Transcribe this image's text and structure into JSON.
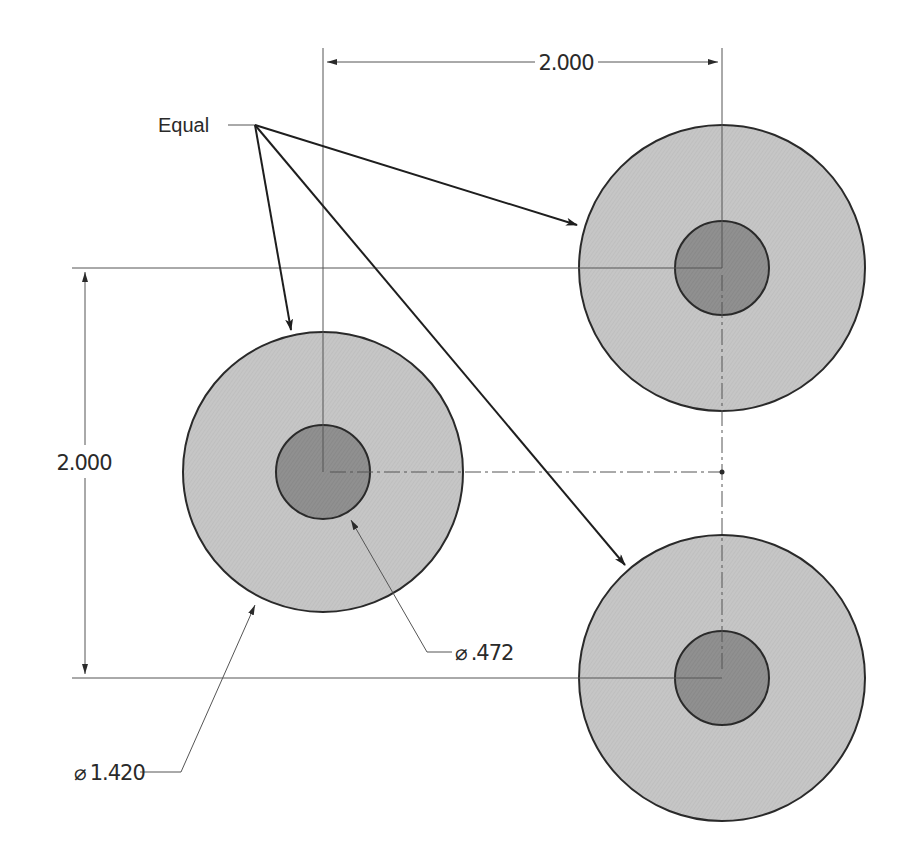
{
  "drawing": {
    "colors": {
      "background": "#ffffff",
      "outer_fill": "#c4c4c4",
      "inner_fill": "#8f8f8f",
      "line": "#2a2a2a",
      "thin_line": "#555555"
    },
    "note": {
      "label": "Equal",
      "arrow_targets": [
        "left-circle-outer",
        "top-right-circle-outer",
        "bottom-right-circle-outer"
      ]
    },
    "dimensions": {
      "horizontal": {
        "value": "2.000"
      },
      "vertical": {
        "value": "2.000"
      },
      "outer_diameter": {
        "symbol": "⌀",
        "value": "1.420"
      },
      "inner_diameter": {
        "symbol": "⌀",
        "value": ".472"
      }
    },
    "circles": [
      {
        "name": "left",
        "cx": 323,
        "cy": 472,
        "outer_r": 140,
        "inner_r": 47
      },
      {
        "name": "top-right",
        "cx": 722,
        "cy": 268,
        "outer_r": 143,
        "inner_r": 47
      },
      {
        "name": "bottom-right",
        "cx": 722,
        "cy": 678,
        "outer_r": 143,
        "inner_r": 47
      }
    ]
  }
}
